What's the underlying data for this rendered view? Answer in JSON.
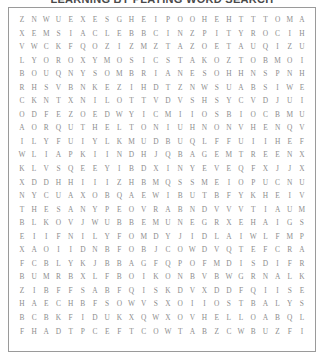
{
  "title": "LEARNING BY PLAYING WORD SEARCH",
  "puzzle": {
    "type": "word-search",
    "rows": 24,
    "cols": 24,
    "letter_color": "#8e8e8e",
    "border_color": "#9a9a9a",
    "background_color": "#ffffff",
    "grid": [
      "ZNWUEXESGHEIPOOHEHTTTOMAR",
      "XEMSIACLEBBCINZPITYROCIHC",
      "VWCKFQOZIZMZTAZOETAUQIZUS",
      "LYOROXYMOSICSTAKOZTOBMOIU",
      "BOUQNYSOMBRIANESOHHNSPNHP",
      "RHSVBNKEZIHDTZNWSUABSIWEZ",
      "CKNTXNILOTTVDVSHSYCVDJUIC",
      "ODFEZOEDWYICMIIOSBIOCBMUI",
      "AORQUTHELTONIUHNONVHENQVY",
      "ILYFUIYLKMUDBUQLFFUIIHEFO",
      "WLIAPKIINDHJQBAGEMTREENXC",
      "KLVSQEEYIBDXINYEVEQFXJJXZ",
      "XDDHHIIIZHBMQSSMEIOPUCNUZ",
      "NYCUAXOBQAEWIBUTBFYKHEIVS",
      "THESANYPEOVRABNDVVVTIAUMA",
      "BLKOVJWUBBEMUNEGRXEHAIGSW",
      "EIIFNILYFOMDYJIDLAIWLFMPS",
      "XAOIIDNBFOBJCOWDVQTEFCRAL",
      "FCBLYKJBBAGFQPOFMDISDIFRO",
      "BUMRBXLFBOIKONBVBWGRNALKF",
      "ZIBFFSABFQISKDVXDDFQIISE",
      "HAECHBFSOWVSXOIIOSTBALYSB",
      "BCBKFIDUKXQWXOVHELLOABQLQ",
      "FHADTPCEFTCOWTABZCWBUZFIA"
    ]
  }
}
